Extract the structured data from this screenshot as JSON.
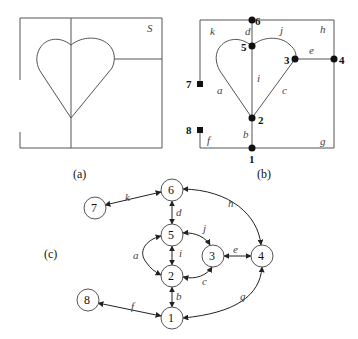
{
  "panels": {
    "a": {
      "caption": "(a)",
      "region_label": "S"
    },
    "b": {
      "caption": "(b)",
      "vertices": {
        "v1": "1",
        "v2": "2",
        "v3": "3",
        "v4": "4",
        "v5": "5",
        "v6": "6",
        "v7": "7",
        "v8": "8"
      },
      "edges": {
        "a": "a",
        "b": "b",
        "c": "c",
        "d": "d",
        "e": "e",
        "f": "f",
        "g": "g",
        "h": "h",
        "i": "i",
        "j": "j",
        "k": "k"
      }
    },
    "c": {
      "caption": "(c)",
      "nodes": {
        "n1": "1",
        "n2": "2",
        "n3": "3",
        "n4": "4",
        "n5": "5",
        "n6": "6",
        "n7": "7",
        "n8": "8"
      },
      "edges": {
        "a": "a",
        "b": "b",
        "c": "c",
        "d": "d",
        "e": "e",
        "f": "f",
        "g": "g",
        "h": "h",
        "i": "i",
        "j": "j",
        "k": "k"
      },
      "adjacency": [
        [
          "7",
          "6",
          "k"
        ],
        [
          "6",
          "5",
          "d"
        ],
        [
          "6",
          "4",
          "h"
        ],
        [
          "5",
          "2",
          "i"
        ],
        [
          "5",
          "2",
          "a"
        ],
        [
          "5",
          "3",
          "j"
        ],
        [
          "2",
          "3",
          "c"
        ],
        [
          "3",
          "4",
          "e"
        ],
        [
          "2",
          "1",
          "b"
        ],
        [
          "8",
          "1",
          "f"
        ],
        [
          "1",
          "4",
          "g"
        ]
      ]
    }
  }
}
